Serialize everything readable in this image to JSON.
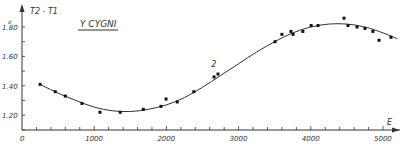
{
  "chart_data": {
    "type": "scatter",
    "title": "Y CYGNI",
    "xlabel": "E",
    "ylabel": "T2 - T1",
    "y_unit": "d",
    "xlim": [
      0,
      5200
    ],
    "ylim": [
      1.1,
      1.9
    ],
    "x_ticks": [
      0,
      1000,
      2000,
      3000,
      4000,
      5000
    ],
    "x_tick_labels": [
      "0",
      "1000",
      "2000",
      "3000",
      "4000",
      "5000"
    ],
    "y_ticks": [
      1.2,
      1.4,
      1.6,
      1.8
    ],
    "y_tick_labels": [
      "1.20",
      "1.40",
      "1.60",
      "1.80"
    ],
    "grid": false,
    "annotations": [
      {
        "text": "2",
        "x": 2650,
        "y": 1.53
      }
    ],
    "series": [
      {
        "name": "observations",
        "kind": "points",
        "x": [
          250,
          460,
          600,
          830,
          1080,
          1360,
          1680,
          1925,
          1995,
          2150,
          2380,
          2660,
          2715,
          3505,
          3600,
          3725,
          3755,
          3890,
          4005,
          4100,
          4460,
          4515,
          4640,
          4750,
          4860,
          4945,
          5110
        ],
        "y": [
          1.41,
          1.36,
          1.33,
          1.28,
          1.22,
          1.22,
          1.24,
          1.26,
          1.31,
          1.29,
          1.36,
          1.46,
          1.48,
          1.7,
          1.75,
          1.77,
          1.75,
          1.77,
          1.81,
          1.81,
          1.86,
          1.81,
          1.8,
          1.79,
          1.77,
          1.71,
          1.73
        ]
      },
      {
        "name": "fitted curve",
        "kind": "line",
        "x": [
          250,
          500,
          750,
          1000,
          1250,
          1500,
          1750,
          2000,
          2250,
          2500,
          2750,
          3000,
          3250,
          3500,
          3750,
          4000,
          4250,
          4500,
          4750,
          5000,
          5200
        ],
        "y": [
          1.41,
          1.35,
          1.3,
          1.255,
          1.23,
          1.225,
          1.24,
          1.27,
          1.32,
          1.39,
          1.47,
          1.55,
          1.63,
          1.7,
          1.76,
          1.8,
          1.82,
          1.82,
          1.8,
          1.76,
          1.72
        ]
      }
    ]
  }
}
